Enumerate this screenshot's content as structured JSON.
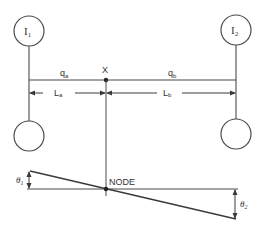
{
  "diagram": {
    "type": "two-inertia shaft node diagram",
    "colors": {
      "line": "#4a4a4a",
      "text": "#333333",
      "background": "#ffffff"
    },
    "inertias": [
      {
        "label_main": "I",
        "label_sub": "1",
        "position": "left"
      },
      {
        "label_main": "I",
        "label_sub": "2",
        "position": "right"
      }
    ],
    "shaft": {
      "segment_a": {
        "label_main": "q",
        "label_sub": "a"
      },
      "segment_b": {
        "label_main": "q",
        "label_sub": "b"
      }
    },
    "dimensions": {
      "length_a": {
        "label_main": "L",
        "label_sub": "a"
      },
      "length_b": {
        "label_main": "L",
        "label_sub": "b"
      }
    },
    "node_point_label": "X",
    "node_label": "NODE",
    "angles": [
      {
        "label_main": "θ",
        "label_sub": "1",
        "position": "left"
      },
      {
        "label_main": "θ",
        "label_sub": "2",
        "position": "right"
      }
    ]
  }
}
